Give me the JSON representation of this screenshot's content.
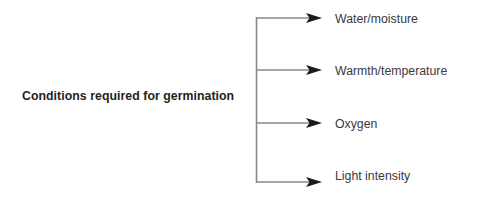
{
  "diagram": {
    "type": "bracket-diagram",
    "root": {
      "label": "Conditions required for germination"
    },
    "branches": [
      {
        "label": "Water/moisture",
        "arrow_y": 18
      },
      {
        "label": "Warmth/temperature",
        "arrow_y": 70
      },
      {
        "label": "Oxygen",
        "arrow_y": 123
      },
      {
        "label": "Light intensity",
        "arrow_y": 182
      }
    ],
    "bracket": {
      "spine_x": 256,
      "spine_top": 17,
      "spine_bottom": 183,
      "arrow_tip_x": 322
    },
    "colors": {
      "line": "#8a8a8a",
      "arrowhead": "#1a1a1a",
      "root_text": "#231f20",
      "branch_text": "#3a3a3a",
      "background": "#ffffff"
    }
  }
}
